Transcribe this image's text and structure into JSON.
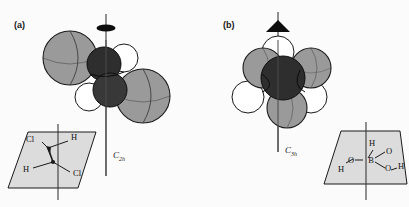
{
  "figure": {
    "background_color": "#fbfbfb",
    "width": 409,
    "height": 207,
    "caption_style": "two-panel symmetry illustration"
  },
  "palette": {
    "sphere_gray": "#9a9a9a",
    "sphere_gray_shade": "#858585",
    "sphere_dark": "#2e2e2e",
    "sphere_dark_shade": "#3c3c3c",
    "sphere_white": "#ffffff",
    "plane_fill": "#dcdcdc",
    "outline": "#1a1a1a",
    "axis_line": "#3a3a3a",
    "text": "#1a1a1a"
  },
  "panels": [
    {
      "id": "a",
      "label": "(a)",
      "molecule_name": "trans-1,2-dichloroethene",
      "axis_label_main": "C",
      "axis_label_sub": "2h",
      "rotation_marker": "lens-ellipse",
      "rotation_order": 2,
      "model_atoms": [
        {
          "element": "Cl",
          "shade": "gray",
          "position": "upper-left"
        },
        {
          "element": "Cl",
          "shade": "gray",
          "position": "lower-right"
        },
        {
          "element": "C",
          "shade": "dark",
          "position": "center-upper"
        },
        {
          "element": "C",
          "shade": "dark",
          "position": "center-lower"
        },
        {
          "element": "H",
          "shade": "white",
          "position": "upper-right"
        },
        {
          "element": "H",
          "shade": "white",
          "position": "lower-left"
        }
      ],
      "structure_atoms": [
        {
          "label": "Cl",
          "position": "top-left"
        },
        {
          "label": "H",
          "position": "top-right"
        },
        {
          "label": "H",
          "position": "bottom-left"
        },
        {
          "label": "Cl",
          "position": "bottom-right"
        }
      ]
    },
    {
      "id": "b",
      "label": "(b)",
      "molecule_name": "boric acid",
      "axis_label_main": "C",
      "axis_label_sub": "3h",
      "rotation_marker": "filled-triangle",
      "rotation_order": 3,
      "model_atoms": [
        {
          "element": "O",
          "shade": "gray",
          "position": "upper-left"
        },
        {
          "element": "O",
          "shade": "gray",
          "position": "upper-right"
        },
        {
          "element": "O",
          "shade": "gray",
          "position": "bottom"
        },
        {
          "element": "B",
          "shade": "dark",
          "position": "center"
        },
        {
          "element": "H",
          "shade": "white",
          "position": "top"
        },
        {
          "element": "H",
          "shade": "white",
          "position": "left"
        },
        {
          "element": "H",
          "shade": "white",
          "position": "right"
        }
      ],
      "structure_atoms": [
        {
          "label": "H",
          "position": "top"
        },
        {
          "label": "O",
          "position": "upper-right"
        },
        {
          "label": "B",
          "position": "center"
        },
        {
          "label": "O",
          "position": "left"
        },
        {
          "label": "O",
          "position": "right-lower"
        },
        {
          "label": "H",
          "position": "lower-left"
        },
        {
          "label": "H",
          "position": "far-right"
        }
      ]
    }
  ]
}
